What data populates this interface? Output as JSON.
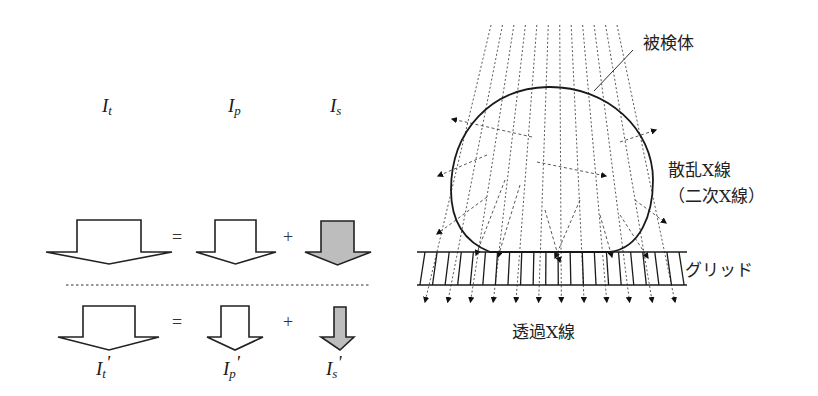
{
  "left_panel": {
    "top_labels": [
      {
        "base": "I",
        "sub": "t",
        "x": 102,
        "y": 112
      },
      {
        "base": "I",
        "sub": "p",
        "x": 228,
        "y": 112
      },
      {
        "base": "I",
        "sub": "s",
        "x": 330,
        "y": 112
      }
    ],
    "row1": {
      "operators": [
        {
          "symbol": "=",
          "x": 172,
          "y": 243
        },
        {
          "symbol": "+",
          "x": 283,
          "y": 243
        }
      ],
      "arrows": [
        {
          "name": "total-intensity-arrow",
          "fill": "white",
          "stem_left": 77,
          "stem_right": 141,
          "top": 220,
          "shoulder": 252,
          "wing_left": 46,
          "wing_right": 172,
          "tip_y": 264
        },
        {
          "name": "primary-intensity-arrow",
          "fill": "white",
          "stem_left": 215,
          "stem_right": 256,
          "top": 220,
          "shoulder": 252,
          "wing_left": 196,
          "wing_right": 276,
          "tip_y": 264
        },
        {
          "name": "scatter-intensity-arrow",
          "fill": "gray",
          "stem_left": 321,
          "stem_right": 354,
          "top": 221,
          "shoulder": 252,
          "wing_left": 305,
          "wing_right": 371,
          "tip_y": 265
        }
      ]
    },
    "separator": {
      "x1": 66,
      "x2": 370,
      "y": 285
    },
    "row2": {
      "operators": [
        {
          "symbol": "=",
          "x": 172,
          "y": 328
        },
        {
          "symbol": "+",
          "x": 283,
          "y": 328
        }
      ],
      "arrows": [
        {
          "name": "total-intensity-prime-arrow",
          "fill": "white",
          "stem_left": 83,
          "stem_right": 135,
          "top": 306,
          "shoulder": 337,
          "wing_left": 58,
          "wing_right": 159,
          "tip_y": 350
        },
        {
          "name": "primary-intensity-prime-arrow",
          "fill": "white",
          "stem_left": 221,
          "stem_right": 249,
          "top": 306,
          "shoulder": 337,
          "wing_left": 207,
          "wing_right": 263,
          "tip_y": 350
        },
        {
          "name": "scatter-intensity-prime-arrow",
          "fill": "gray",
          "stem_left": 334,
          "stem_right": 346,
          "top": 307,
          "shoulder": 337,
          "wing_left": 321,
          "wing_right": 354,
          "tip_y": 350
        }
      ]
    },
    "bottom_labels": [
      {
        "base": "I",
        "sub": "t",
        "prime": "'",
        "x": 96,
        "y": 375
      },
      {
        "base": "I",
        "sub": "p",
        "prime": "'",
        "x": 223,
        "y": 375
      },
      {
        "base": "I",
        "sub": "s",
        "prime": "'",
        "x": 326,
        "y": 375
      }
    ]
  },
  "right_panel": {
    "labels": {
      "subject": "被検体",
      "scatter_xray": "散乱X線",
      "secondary_xray": "（二次X線）",
      "grid": "グリッド",
      "transmitted_xray": "透過X線"
    },
    "label_positions": {
      "subject": {
        "x": 643,
        "y": 49
      },
      "scatter_xray": {
        "x": 668,
        "y": 176
      },
      "secondary_xray": {
        "x": 672,
        "y": 202
      },
      "grid": {
        "x": 685,
        "y": 276
      },
      "transmitted_xray": {
        "x": 512,
        "y": 338
      }
    },
    "leader_line": {
      "x1": 594,
      "y1": 91,
      "x2": 633,
      "y2": 50
    },
    "rays": {
      "count": 12,
      "top_y": 25,
      "top_x_start": 491,
      "top_x_end": 617,
      "bottom_y": 302,
      "bottom_x_start": 425,
      "bottom_x_end": 675
    },
    "grid": {
      "x1": 417,
      "x2": 687,
      "top_y": 252,
      "bottom_y": 285,
      "slat_count": 22
    },
    "scatter_rays": [
      {
        "x1": 532,
        "y1": 137,
        "x2": 452,
        "y2": 119
      },
      {
        "x1": 487,
        "y1": 155,
        "x2": 438,
        "y2": 176
      },
      {
        "x1": 487,
        "y1": 197,
        "x2": 437,
        "y2": 234
      },
      {
        "x1": 620,
        "y1": 142,
        "x2": 656,
        "y2": 130
      },
      {
        "x1": 537,
        "y1": 162,
        "x2": 606,
        "y2": 176
      },
      {
        "x1": 635,
        "y1": 200,
        "x2": 666,
        "y2": 223
      },
      {
        "x1": 505,
        "y1": 180,
        "x2": 476,
        "y2": 255
      },
      {
        "x1": 520,
        "y1": 185,
        "x2": 498,
        "y2": 257
      },
      {
        "x1": 580,
        "y1": 200,
        "x2": 555,
        "y2": 258
      },
      {
        "x1": 600,
        "y1": 215,
        "x2": 612,
        "y2": 257
      },
      {
        "x1": 545,
        "y1": 210,
        "x2": 560,
        "y2": 262
      },
      {
        "x1": 620,
        "y1": 215,
        "x2": 648,
        "y2": 258
      }
    ],
    "colors": {
      "ink": "#1a1a1a",
      "gray_fill": "#bdbdbd"
    }
  }
}
